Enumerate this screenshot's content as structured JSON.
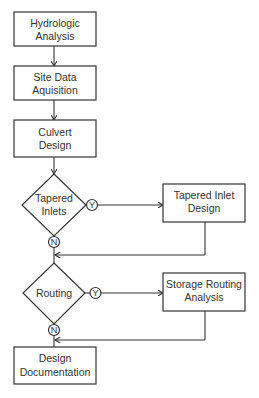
{
  "flowchart": {
    "nodes": {
      "hydrologic": {
        "line1": "Hydrologic",
        "line2": "Analysis"
      },
      "site_data": {
        "line1": "Site Data",
        "line2": "Aquisition"
      },
      "culvert": {
        "line1": "Culvert",
        "line2": "Design"
      },
      "tapered_inlets": {
        "line1": "Tapered",
        "line2": "Inlets"
      },
      "tapered_inlet_design": {
        "line1": "Tapered Inlet",
        "line2": "Design"
      },
      "routing": {
        "line1": "Routing"
      },
      "storage_routing": {
        "line1": "Storage Routing",
        "line2": "Analysis"
      },
      "design_doc": {
        "line1": "Design",
        "line2": "Documentation"
      }
    },
    "markers": {
      "yes": "Y",
      "no": "N"
    }
  }
}
